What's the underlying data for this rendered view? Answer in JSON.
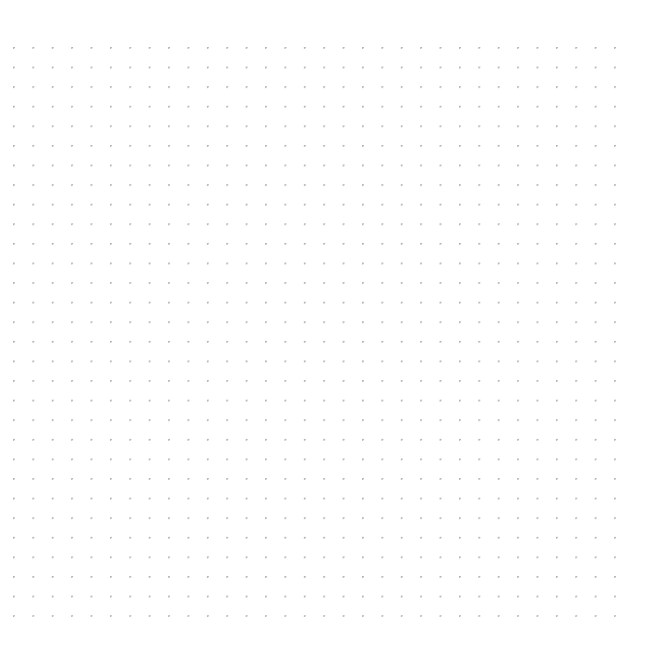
{
  "canvas": {
    "name": "dot-grid-canvas",
    "background_color": "#ffffff",
    "width": 650,
    "height": 661,
    "empty_state_text": "",
    "grid": {
      "type": "dot-grid",
      "dot_color": "#b3b3bb",
      "dot_size_px": 1.5,
      "spacing_x_px": 19.4,
      "spacing_y_px": 19.6,
      "origin_x_px": 14,
      "origin_y_px": 48,
      "columns": 32,
      "rows": 30,
      "margin_top_px": 48,
      "margin_left_px": 14,
      "margin_right_px": 27,
      "margin_bottom_px": 43
    }
  }
}
